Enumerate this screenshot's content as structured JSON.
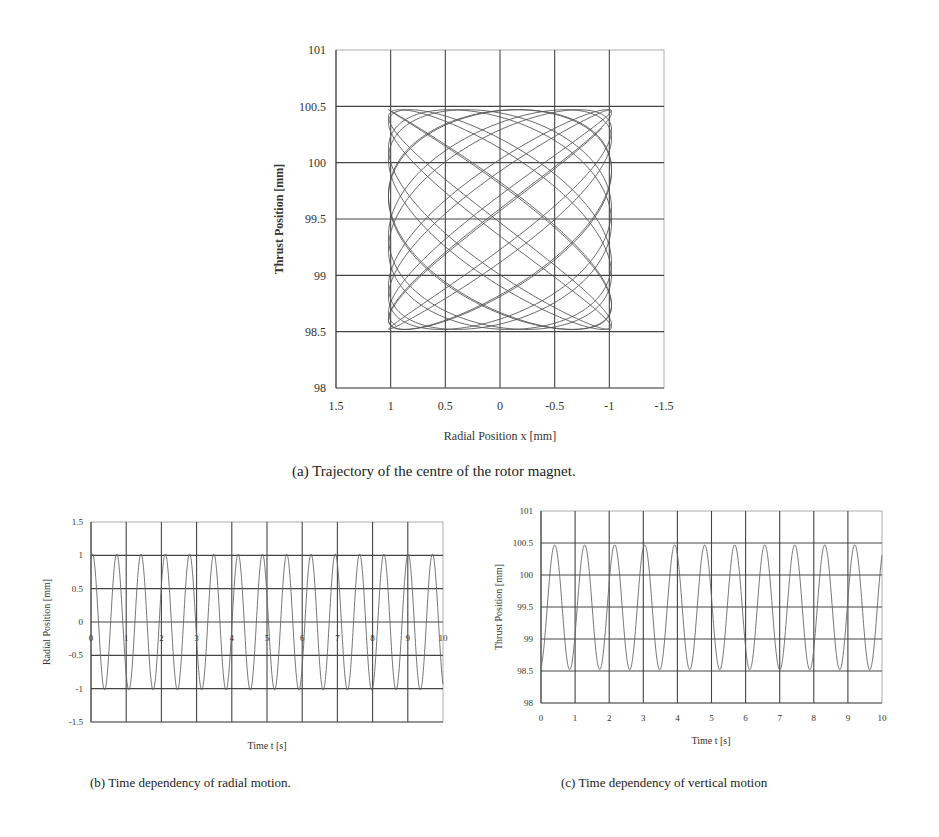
{
  "figures": {
    "a": {
      "caption": "(a) Trajectory of the centre of the rotor magnet.",
      "xlabel": "Radial Position x  [mm]",
      "ylabel": "Thrust Position [mm]",
      "xticks": [
        "1.5",
        "1",
        "0.5",
        "0",
        "-0.5",
        "-1",
        "-1.5"
      ],
      "yticks": [
        "101",
        "100.5",
        "100",
        "99.5",
        "99",
        "98.5",
        "98"
      ]
    },
    "b": {
      "caption": "(b) Time dependency of radial motion.",
      "xlabel": "Time t [s]",
      "ylabel": "Radial Position [mm]",
      "xticks": [
        "0",
        "1",
        "2",
        "3",
        "4",
        "5",
        "6",
        "7",
        "8",
        "9",
        "10"
      ],
      "yticks": [
        "1.5",
        "1",
        "0.5",
        "0",
        "-0.5",
        "-1",
        "-1.5"
      ]
    },
    "c": {
      "caption": "(c) Time dependency of vertical motion",
      "xlabel": "Time t [s]",
      "ylabel": "Thrust Position [mm]",
      "xticks": [
        "0",
        "1",
        "2",
        "3",
        "4",
        "5",
        "6",
        "7",
        "8",
        "9",
        "10"
      ],
      "yticks": [
        "101",
        "100.5",
        "100",
        "99.5",
        "99",
        "98.5",
        "98"
      ]
    }
  },
  "chart_data": [
    {
      "type": "line",
      "title": "(a) Trajectory of the centre of the rotor magnet.",
      "xlabel": "Radial Position x [mm]",
      "ylabel": "Thrust Position [mm]",
      "xlim": [
        1.5,
        -1.5
      ],
      "ylim": [
        98,
        101
      ],
      "x_inverted": true,
      "grid": true,
      "legend": null,
      "description": "Lissajous-like trajectory filling the box x in [-1.03, 1.03], y in [98.52, 100.47]",
      "series": [
        {
          "name": "trajectory",
          "x_amplitude": 1.02,
          "x_center": 0,
          "x_period_s": 0.69,
          "y_amplitude": 0.975,
          "y_center": 99.495,
          "y_period_s": 0.88,
          "duration_s": 10
        }
      ]
    },
    {
      "type": "line",
      "title": "(b) Time dependency of radial motion.",
      "xlabel": "Time t [s]",
      "ylabel": "Radial Position [mm]",
      "xlim": [
        0,
        10
      ],
      "ylim": [
        -1.5,
        1.5
      ],
      "grid": true,
      "legend": null,
      "series": [
        {
          "name": "radial position",
          "amplitude": 1.02,
          "offset": 0,
          "period_s": 0.69,
          "phase_rad": 1.2,
          "peak_times": [
            0.03,
            0.65,
            1.34,
            2.02,
            2.7,
            3.38,
            4.07,
            4.75,
            5.44,
            6.12,
            6.8,
            7.49,
            8.17,
            8.86,
            9.54
          ],
          "peak_value": 1.03,
          "trough_value": -1.02
        }
      ]
    },
    {
      "type": "line",
      "title": "(c) Time dependency of vertical motion",
      "xlabel": "Time t [s]",
      "ylabel": "Thrust Position [mm]",
      "xlim": [
        0,
        10
      ],
      "ylim": [
        98,
        101
      ],
      "grid": true,
      "legend": null,
      "series": [
        {
          "name": "thrust position",
          "amplitude": 0.975,
          "offset": 99.495,
          "period_s": 0.88,
          "phase_rad": -1.3,
          "peak_times": [
            0.45,
            1.33,
            2.21,
            3.09,
            3.97,
            4.85,
            5.73,
            6.61,
            7.49,
            8.37,
            9.25
          ],
          "peak_value": 100.47,
          "trough_value": 98.52
        }
      ]
    }
  ]
}
